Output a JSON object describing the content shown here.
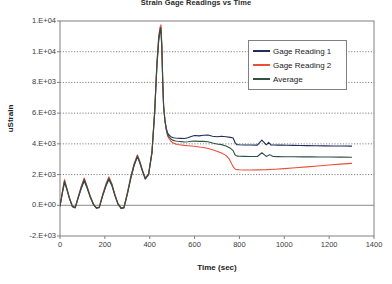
{
  "chart_data": {
    "type": "line",
    "title": "Strain Gage Readings vs Time",
    "xlabel": "Time (sec)",
    "ylabel": "uStrain",
    "xlim": [
      0,
      1400
    ],
    "ylim": [
      -2000,
      12000
    ],
    "xticks": [
      0,
      200,
      400,
      600,
      800,
      1000,
      1200,
      1400
    ],
    "xtick_labels": [
      "0",
      "200",
      "400",
      "600",
      "800",
      "1000",
      "1200",
      "1400"
    ],
    "yticks": [
      12000,
      10000,
      8000,
      6000,
      4000,
      2000,
      0,
      -2000
    ],
    "ytick_labels": [
      "1.E+04",
      "1.E+04",
      "8.E+03",
      "6.E+03",
      "4.E+03",
      "2.E+03",
      "0.E+00",
      "-2.E+03"
    ],
    "grid": true,
    "grid_style": "dotted-horizontal",
    "legend_position": "upper right",
    "colors": {
      "gage1": "#1F2E5C",
      "gage2": "#E8503A",
      "average": "#2D5241",
      "axis": "#808080",
      "grid": "#666666",
      "text": "#333333"
    },
    "series": [
      {
        "name": "Gage Reading 1",
        "color": "#1F2E5C",
        "x": [
          0,
          12,
          20,
          30,
          42,
          55,
          68,
          80,
          95,
          108,
          120,
          135,
          150,
          162,
          175,
          190,
          205,
          218,
          232,
          245,
          258,
          272,
          285,
          300,
          315,
          330,
          345,
          355,
          368,
          380,
          395,
          410,
          422,
          432,
          440,
          446,
          450,
          454,
          458,
          462,
          468,
          474,
          480,
          488,
          496,
          505,
          515,
          525,
          540,
          555,
          570,
          585,
          600,
          620,
          640,
          660,
          680,
          700,
          720,
          740,
          760,
          772,
          780,
          788,
          800,
          820,
          850,
          880,
          900,
          920,
          930,
          940,
          955,
          970,
          990,
          1010,
          1040,
          1070,
          1100,
          1140,
          1180,
          1220,
          1260,
          1300
        ],
        "y": [
          -60,
          900,
          1480,
          1050,
          430,
          -90,
          -170,
          420,
          1100,
          1580,
          1150,
          520,
          20,
          -190,
          -150,
          600,
          1250,
          1680,
          1250,
          620,
          90,
          -200,
          -170,
          700,
          1700,
          2550,
          3150,
          2800,
          2200,
          1700,
          2000,
          3400,
          6000,
          9000,
          10700,
          11300,
          11400,
          10200,
          8000,
          6400,
          5500,
          5000,
          4700,
          4550,
          4450,
          4400,
          4380,
          4370,
          4360,
          4350,
          4400,
          4480,
          4540,
          4520,
          4560,
          4580,
          4500,
          4460,
          4500,
          4460,
          4420,
          4380,
          4100,
          3950,
          3940,
          3930,
          3930,
          3920,
          4250,
          3940,
          4100,
          3930,
          3930,
          3920,
          3920,
          3910,
          3900,
          3890,
          3885,
          3880,
          3870,
          3865,
          3860,
          3855
        ]
      },
      {
        "name": "Gage Reading 2",
        "color": "#E8503A",
        "x": [
          0,
          12,
          20,
          30,
          42,
          55,
          68,
          80,
          95,
          108,
          120,
          135,
          150,
          162,
          175,
          190,
          205,
          218,
          232,
          245,
          258,
          272,
          285,
          300,
          315,
          330,
          345,
          355,
          368,
          380,
          395,
          410,
          422,
          432,
          440,
          446,
          450,
          454,
          458,
          462,
          468,
          474,
          480,
          488,
          496,
          505,
          515,
          525,
          540,
          555,
          570,
          585,
          600,
          620,
          640,
          660,
          680,
          700,
          720,
          740,
          755,
          765,
          775,
          782,
          790,
          800,
          820,
          850,
          880,
          920,
          960,
          1000,
          1050,
          1100,
          1150,
          1200,
          1250,
          1300
        ],
        "y": [
          -40,
          1000,
          1680,
          1150,
          500,
          -30,
          -120,
          500,
          1250,
          1780,
          1280,
          600,
          60,
          -150,
          -110,
          700,
          1400,
          1850,
          1380,
          700,
          130,
          -160,
          -130,
          800,
          1850,
          2700,
          3280,
          2900,
          2280,
          1780,
          2050,
          3500,
          6100,
          9300,
          11000,
          11600,
          11750,
          10500,
          8200,
          6500,
          5500,
          4900,
          4500,
          4300,
          4150,
          4050,
          4000,
          3960,
          3930,
          3900,
          3880,
          3860,
          3840,
          3800,
          3760,
          3700,
          3620,
          3520,
          3400,
          3250,
          3000,
          2700,
          2450,
          2350,
          2320,
          2310,
          2300,
          2300,
          2305,
          2320,
          2350,
          2390,
          2440,
          2500,
          2560,
          2620,
          2680,
          2730
        ]
      },
      {
        "name": "Average",
        "color": "#2D5241",
        "x": [
          0,
          12,
          20,
          30,
          42,
          55,
          68,
          80,
          95,
          108,
          120,
          135,
          150,
          162,
          175,
          190,
          205,
          218,
          232,
          245,
          258,
          272,
          285,
          300,
          315,
          330,
          345,
          355,
          368,
          380,
          395,
          410,
          422,
          432,
          440,
          446,
          450,
          454,
          458,
          462,
          468,
          474,
          480,
          488,
          496,
          505,
          515,
          525,
          540,
          555,
          570,
          585,
          600,
          620,
          640,
          660,
          680,
          700,
          720,
          740,
          760,
          772,
          780,
          790,
          800,
          820,
          850,
          880,
          900,
          920,
          935,
          950,
          970,
          1000,
          1040,
          1080,
          1120,
          1160,
          1200,
          1250,
          1300
        ],
        "y": [
          -50,
          950,
          1580,
          1100,
          465,
          -60,
          -145,
          460,
          1175,
          1680,
          1215,
          560,
          40,
          -170,
          -130,
          650,
          1325,
          1765,
          1315,
          660,
          110,
          -180,
          -150,
          750,
          1775,
          2625,
          3215,
          2850,
          2240,
          1740,
          2025,
          3450,
          6050,
          9150,
          10850,
          11450,
          11575,
          10350,
          8100,
          6450,
          5500,
          4950,
          4600,
          4425,
          4300,
          4225,
          4190,
          4165,
          4145,
          4125,
          4140,
          4170,
          4190,
          4160,
          4160,
          4140,
          4060,
          3990,
          3950,
          3855,
          3710,
          3560,
          3290,
          3200,
          3190,
          3185,
          3180,
          3175,
          3420,
          3180,
          3300,
          3175,
          3170,
          3165,
          3160,
          3155,
          3150,
          3145,
          3140,
          3135,
          3130
        ]
      }
    ]
  },
  "legend": {
    "items": [
      {
        "label": "Gage Reading 1",
        "color": "#1F2E5C"
      },
      {
        "label": "Gage Reading 2",
        "color": "#E8503A"
      },
      {
        "label": "Average",
        "color": "#2D5241"
      }
    ]
  }
}
